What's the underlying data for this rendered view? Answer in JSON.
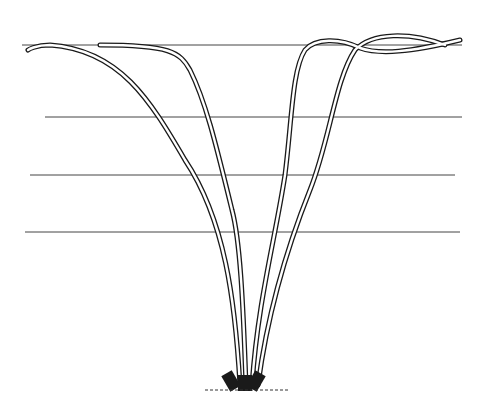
{
  "illustration": {
    "subject": "four canes tied to a four-wire trellis",
    "wires": [
      {
        "y": 45,
        "x1": 22,
        "x2": 462
      },
      {
        "y": 117,
        "x1": 45,
        "x2": 462
      },
      {
        "y": 175,
        "x1": 30,
        "x2": 455
      },
      {
        "y": 232,
        "x1": 25,
        "x2": 460
      }
    ],
    "colors": {
      "ink": "#1a1a1a",
      "wire": "#444444",
      "background": "#ffffff"
    }
  }
}
